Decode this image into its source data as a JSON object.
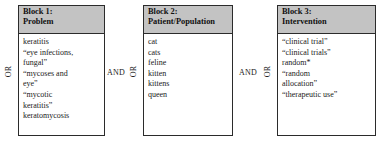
{
  "diagram": {
    "type": "boolean-search-strategy",
    "blocks": [
      {
        "id": "block-1",
        "header_lines": [
          "Block 1:",
          "Problem"
        ],
        "title": "Block 1: Problem",
        "internal_operator": "OR",
        "terms": [
          "keratitis",
          "“eye infections,",
          "fungal”",
          "“mycoses and",
          "eye”",
          "“mycotic",
          "keratitis”",
          "keratomycosis"
        ]
      },
      {
        "id": "block-2",
        "header_lines": [
          "Block 2:",
          "Patient/Population"
        ],
        "title": "Block 2: Patient/Population",
        "internal_operator": "OR",
        "terms": [
          "cat",
          "cats",
          "feline",
          "kitten",
          "kittens",
          "queen"
        ]
      },
      {
        "id": "block-3",
        "header_lines": [
          "Block 3:",
          "Intervention"
        ],
        "title": "Block 3: Intervention",
        "internal_operator": "OR",
        "terms": [
          "“clinical trial”",
          "“clinical trials”",
          "random*",
          "“random",
          "allocation”",
          "“therapeutic use”"
        ]
      }
    ],
    "operators": {
      "or_1": "OR",
      "or_2": "OR",
      "or_3": "OR",
      "and_1": "AND",
      "and_2": "AND"
    },
    "colors": {
      "header_fill": "#c3c3c3",
      "border": "#2b2b2b",
      "text": "#1a1a1a",
      "background": "#ffffff"
    }
  }
}
